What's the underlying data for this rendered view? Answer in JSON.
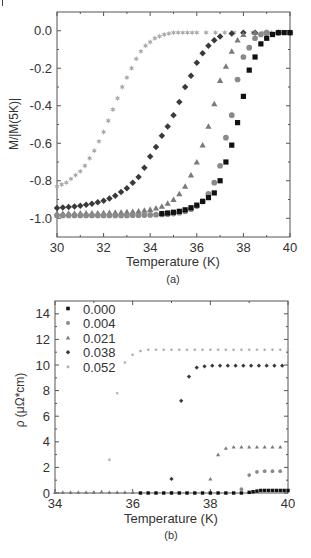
{
  "figure": {
    "corner_mark": "|",
    "panels": [
      {
        "caption": "(a)"
      },
      {
        "caption": "(b)"
      }
    ]
  },
  "colors": {
    "axis": "#555555",
    "text": "#333333",
    "s000": "#111111",
    "s004": "#8a8a8a",
    "s021": "#7a7a7a",
    "s038": "#3a3a3a",
    "s052": "#a8a8a8"
  },
  "chart_data": [
    {
      "type": "scatter",
      "panel": "(a)",
      "title": "",
      "xlabel": "Temperature (K)",
      "ylabel": "M/|M(5K)|",
      "xlim": [
        30,
        40
      ],
      "ylim": [
        -1.1,
        0.1
      ],
      "xticks": [
        30,
        32,
        34,
        36,
        38,
        40
      ],
      "xtick_labels": [
        "30",
        "32",
        "34",
        "36",
        "38",
        "40"
      ],
      "yticks": [
        0.0,
        -0.2,
        -0.4,
        -0.6,
        -0.8,
        -1.0
      ],
      "ytick_labels": [
        "0.0",
        "-0.2",
        "-0.4",
        "-0.6",
        "-0.8",
        "-1.0"
      ],
      "grid": false,
      "legend": null,
      "series": [
        {
          "name": "0.052",
          "marker": "star",
          "color": "#a8a8a8",
          "x": [
            30.0,
            30.2,
            30.4,
            30.6,
            30.8,
            31.0,
            31.2,
            31.4,
            31.6,
            31.8,
            32.0,
            32.2,
            32.4,
            32.6,
            32.8,
            33.0,
            33.2,
            33.4,
            33.6,
            33.8,
            34.0,
            34.2,
            34.4,
            34.6,
            34.8,
            35.0,
            35.2,
            35.4,
            35.6,
            35.8,
            36.0,
            36.4,
            36.8,
            37.2,
            37.6,
            38.0,
            38.4,
            38.8,
            39.2,
            39.6,
            40.0
          ],
          "y": [
            -0.83,
            -0.82,
            -0.81,
            -0.79,
            -0.77,
            -0.75,
            -0.72,
            -0.68,
            -0.64,
            -0.59,
            -0.54,
            -0.48,
            -0.42,
            -0.36,
            -0.3,
            -0.25,
            -0.2,
            -0.15,
            -0.11,
            -0.08,
            -0.06,
            -0.04,
            -0.03,
            -0.02,
            -0.015,
            -0.01,
            -0.01,
            -0.01,
            -0.01,
            -0.01,
            -0.01,
            -0.01,
            -0.01,
            -0.01,
            -0.01,
            -0.01,
            -0.01,
            -0.01,
            -0.01,
            -0.01,
            -0.01
          ]
        },
        {
          "name": "0.038",
          "marker": "diamond",
          "color": "#3a3a3a",
          "x": [
            30.0,
            30.25,
            30.5,
            30.75,
            31.0,
            31.25,
            31.5,
            31.75,
            32.0,
            32.25,
            32.5,
            32.75,
            33.0,
            33.25,
            33.5,
            33.75,
            34.0,
            34.25,
            34.5,
            34.75,
            35.0,
            35.25,
            35.5,
            35.75,
            36.0,
            36.25,
            36.5,
            36.75,
            37.0,
            37.5,
            38.0,
            38.5,
            39.0,
            39.5,
            40.0
          ],
          "y": [
            -0.945,
            -0.943,
            -0.94,
            -0.937,
            -0.933,
            -0.928,
            -0.922,
            -0.915,
            -0.906,
            -0.895,
            -0.88,
            -0.86,
            -0.84,
            -0.81,
            -0.78,
            -0.73,
            -0.67,
            -0.62,
            -0.56,
            -0.51,
            -0.45,
            -0.38,
            -0.3,
            -0.24,
            -0.17,
            -0.12,
            -0.08,
            -0.05,
            -0.03,
            -0.015,
            -0.01,
            -0.01,
            -0.01,
            -0.01,
            -0.01
          ]
        },
        {
          "name": "0.021",
          "marker": "triangle",
          "color": "#7a7a7a",
          "x": [
            30.0,
            30.25,
            30.5,
            30.75,
            31.0,
            31.25,
            31.5,
            31.75,
            32.0,
            32.25,
            32.5,
            32.75,
            33.0,
            33.25,
            33.5,
            33.75,
            34.0,
            34.25,
            34.5,
            34.75,
            35.0,
            35.25,
            35.5,
            35.75,
            36.0,
            36.25,
            36.5,
            36.75,
            37.0,
            37.25,
            37.5,
            37.75,
            38.0,
            38.5,
            39.0,
            39.5,
            40.0
          ],
          "y": [
            -0.975,
            -0.975,
            -0.974,
            -0.974,
            -0.973,
            -0.973,
            -0.972,
            -0.972,
            -0.971,
            -0.97,
            -0.969,
            -0.968,
            -0.966,
            -0.964,
            -0.962,
            -0.958,
            -0.953,
            -0.946,
            -0.936,
            -0.92,
            -0.9,
            -0.87,
            -0.83,
            -0.77,
            -0.7,
            -0.61,
            -0.51,
            -0.39,
            -0.265,
            -0.19,
            -0.11,
            -0.05,
            -0.02,
            -0.01,
            -0.01,
            -0.01,
            -0.01
          ]
        },
        {
          "name": "0.004",
          "marker": "circle",
          "color": "#8a8a8a",
          "x": [
            30.0,
            30.25,
            30.5,
            30.75,
            31.0,
            31.25,
            31.5,
            31.75,
            32.0,
            32.25,
            32.5,
            32.75,
            33.0,
            33.25,
            33.5,
            33.75,
            34.0,
            34.25,
            34.5,
            34.75,
            35.0,
            35.25,
            35.5,
            35.75,
            36.0,
            36.25,
            36.5,
            36.75,
            37.0,
            37.25,
            37.5,
            37.75,
            38.0,
            38.25,
            38.5,
            38.75,
            39.0,
            39.5,
            40.0
          ],
          "y": [
            -0.985,
            -0.985,
            -0.985,
            -0.985,
            -0.985,
            -0.985,
            -0.985,
            -0.985,
            -0.985,
            -0.985,
            -0.985,
            -0.985,
            -0.985,
            -0.984,
            -0.984,
            -0.983,
            -0.982,
            -0.981,
            -0.98,
            -0.978,
            -0.975,
            -0.97,
            -0.963,
            -0.952,
            -0.935,
            -0.91,
            -0.87,
            -0.81,
            -0.72,
            -0.57,
            -0.45,
            -0.26,
            -0.14,
            -0.09,
            -0.04,
            -0.02,
            -0.01,
            -0.01,
            -0.01
          ]
        },
        {
          "name": "0.000",
          "marker": "square",
          "color": "#111111",
          "x": [
            34.5,
            34.75,
            35.0,
            35.25,
            35.5,
            35.75,
            36.0,
            36.25,
            36.5,
            36.75,
            37.0,
            37.25,
            37.5,
            37.75,
            38.0,
            38.25,
            38.5,
            38.75,
            39.0,
            39.25,
            39.5,
            39.75,
            40.0
          ],
          "y": [
            -0.975,
            -0.972,
            -0.968,
            -0.963,
            -0.955,
            -0.944,
            -0.93,
            -0.91,
            -0.89,
            -0.865,
            -0.8,
            -0.7,
            -0.61,
            -0.49,
            -0.35,
            -0.21,
            -0.14,
            -0.07,
            -0.04,
            -0.02,
            -0.01,
            -0.01,
            -0.01
          ]
        }
      ]
    },
    {
      "type": "scatter",
      "panel": "(b)",
      "title": "",
      "xlabel": "Temperature (K)",
      "ylabel": "ρ (μΩ*cm)",
      "xlim": [
        34,
        40
      ],
      "ylim": [
        0,
        15
      ],
      "xticks": [
        34,
        36,
        38,
        40
      ],
      "xtick_labels": [
        "34",
        "36",
        "38",
        "40"
      ],
      "yticks": [
        0,
        2,
        4,
        6,
        8,
        10,
        12,
        14
      ],
      "ytick_labels": [
        "0",
        "2",
        "4",
        "6",
        "8",
        "10",
        "12",
        "14"
      ],
      "grid": false,
      "legend": {
        "position": "upper left",
        "entries": [
          "0.000",
          "0.004",
          "0.021",
          "0.038",
          "0.052"
        ]
      },
      "series": [
        {
          "name": "0.000",
          "marker": "square",
          "color": "#111111",
          "x": [
            36.2,
            36.4,
            36.6,
            36.8,
            37.0,
            37.2,
            37.4,
            37.6,
            37.8,
            38.0,
            38.2,
            38.4,
            38.6,
            38.8,
            39.0,
            39.1,
            39.2,
            39.3,
            39.4,
            39.5,
            39.6,
            39.7,
            39.8,
            39.9,
            40.0
          ],
          "y": [
            0.0,
            0.0,
            0.0,
            0.0,
            0.0,
            0.0,
            0.0,
            0.0,
            0.0,
            0.0,
            0.0,
            0.0,
            0.0,
            0.0,
            0.05,
            0.1,
            0.15,
            0.2,
            0.2,
            0.2,
            0.2,
            0.2,
            0.2,
            0.2,
            0.2
          ]
        },
        {
          "name": "0.004",
          "marker": "circle",
          "color": "#8a8a8a",
          "x": [
            38.8,
            39.0,
            39.2,
            39.4,
            39.6,
            39.8
          ],
          "y": [
            0.3,
            1.4,
            1.65,
            1.7,
            1.7,
            1.7
          ]
        },
        {
          "name": "0.021",
          "marker": "triangle",
          "color": "#7a7a7a",
          "x": [
            34.0,
            34.2,
            34.4,
            34.6,
            34.8,
            35.0,
            35.2,
            35.4,
            35.6,
            35.8,
            36.0,
            38.0,
            38.2,
            38.4,
            38.6,
            38.8,
            39.0,
            39.2,
            39.4,
            39.6,
            39.8
          ],
          "y": [
            0.05,
            0.05,
            0.05,
            0.05,
            0.05,
            0.05,
            0.1,
            0.05,
            0.05,
            0.05,
            0.05,
            1.1,
            3.0,
            3.5,
            3.6,
            3.6,
            3.6,
            3.6,
            3.6,
            3.6,
            3.6
          ]
        },
        {
          "name": "0.038",
          "marker": "diamond",
          "color": "#3a3a3a",
          "x": [
            37.0,
            37.25,
            37.45,
            37.65,
            37.85,
            38.05,
            38.25,
            38.45,
            38.65,
            38.85,
            39.05,
            39.25,
            39.45,
            39.65,
            39.85
          ],
          "y": [
            1.1,
            7.2,
            9.1,
            9.8,
            9.9,
            9.95,
            9.95,
            9.95,
            9.95,
            9.95,
            9.95,
            9.95,
            9.95,
            9.95,
            9.95
          ]
        },
        {
          "name": "0.052",
          "marker": "star",
          "color": "#a8a8a8",
          "x": [
            35.4,
            35.6,
            35.8,
            36.0,
            36.2,
            36.4,
            36.6,
            36.8,
            37.0,
            37.2,
            37.4,
            37.6,
            37.8,
            38.0,
            38.2,
            38.4,
            38.6,
            38.8,
            39.0,
            39.2,
            39.4,
            39.6,
            39.8,
            40.0
          ],
          "y": [
            2.6,
            7.8,
            10.2,
            10.8,
            11.1,
            11.2,
            11.2,
            11.2,
            11.2,
            11.2,
            11.2,
            11.2,
            11.2,
            11.2,
            11.2,
            11.2,
            11.2,
            11.2,
            11.2,
            11.2,
            11.2,
            11.2,
            11.2,
            11.2
          ]
        }
      ]
    }
  ]
}
